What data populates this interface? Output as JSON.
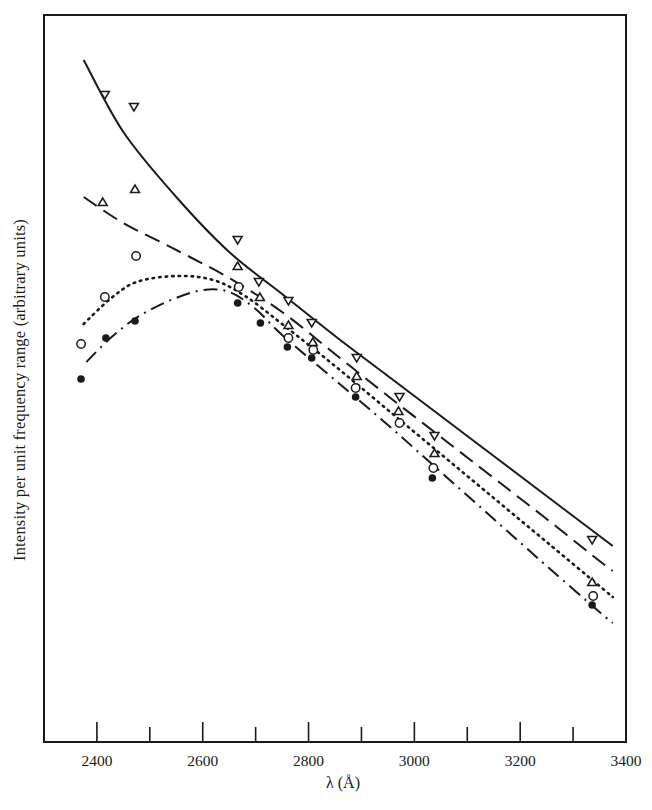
{
  "chart_data": {
    "type": "line",
    "title": "",
    "xlabel": "λ (Å)",
    "ylabel": "Intensity per unit frequency range (arbitrary units)",
    "xlim": [
      2300,
      3400
    ],
    "ylim": [
      0,
      72.7
    ],
    "x_ticks": [
      2400,
      2500,
      2600,
      2700,
      2800,
      2900,
      3000,
      3100,
      3200,
      3300,
      3400
    ],
    "x_tick_labels": [
      "2400",
      "2600",
      "2800",
      "3000",
      "3200",
      "3400"
    ],
    "y_ticks": [],
    "grid": false,
    "legend": "none",
    "series": [
      {
        "name": "down-triangle (solid curve)",
        "marker": "down-triangle",
        "line_style": "solid",
        "points": [
          [
            2415,
            64.7
          ],
          [
            2470,
            63.5
          ],
          [
            2666,
            50.2
          ],
          [
            2706,
            46.0
          ],
          [
            2762,
            44.1
          ],
          [
            2806,
            41.9
          ],
          [
            2891,
            38.4
          ],
          [
            2972,
            34.5
          ],
          [
            3038,
            30.6
          ],
          [
            3336,
            20.2
          ]
        ],
        "curve": [
          [
            2375,
            68.2
          ],
          [
            2450,
            61.0
          ],
          [
            2550,
            54.5
          ],
          [
            2650,
            49.0
          ],
          [
            2750,
            44.8
          ],
          [
            2850,
            40.6
          ],
          [
            2950,
            36.6
          ],
          [
            3050,
            32.6
          ],
          [
            3150,
            28.6
          ],
          [
            3250,
            24.6
          ],
          [
            3350,
            20.6
          ],
          [
            3375,
            19.6
          ]
        ]
      },
      {
        "name": "up-triangle (dashed curve)",
        "marker": "up-triangle",
        "line_style": "dashed",
        "points": [
          [
            2411,
            54.0
          ],
          [
            2472,
            55.3
          ],
          [
            2666,
            47.6
          ],
          [
            2708,
            44.5
          ],
          [
            2762,
            41.7
          ],
          [
            2808,
            40.0
          ],
          [
            2891,
            36.6
          ],
          [
            2970,
            33.1
          ],
          [
            3038,
            28.9
          ],
          [
            3336,
            16.0
          ]
        ],
        "curve": [
          [
            2375,
            54.5
          ],
          [
            2450,
            51.9
          ],
          [
            2550,
            49.2
          ],
          [
            2650,
            46.4
          ],
          [
            2750,
            43.0
          ],
          [
            2850,
            38.8
          ],
          [
            2950,
            34.6
          ],
          [
            3050,
            30.5
          ],
          [
            3150,
            26.4
          ],
          [
            3250,
            22.3
          ],
          [
            3350,
            18.1
          ],
          [
            3375,
            17.1
          ]
        ]
      },
      {
        "name": "open circle (dotted curve)",
        "marker": "open-circle",
        "line_style": "dotted",
        "points": [
          [
            2370,
            39.8
          ],
          [
            2415,
            44.5
          ],
          [
            2474,
            48.6
          ],
          [
            2668,
            45.5
          ],
          [
            2762,
            40.4
          ],
          [
            2809,
            39.2
          ],
          [
            2889,
            35.4
          ],
          [
            2972,
            31.9
          ],
          [
            3036,
            27.4
          ],
          [
            3338,
            14.6
          ]
        ],
        "curve": [
          [
            2375,
            41.8
          ],
          [
            2425,
            44.3
          ],
          [
            2475,
            46.0
          ],
          [
            2550,
            46.6
          ],
          [
            2620,
            46.2
          ],
          [
            2680,
            44.6
          ],
          [
            2750,
            41.8
          ],
          [
            2850,
            37.6
          ],
          [
            2950,
            33.2
          ],
          [
            3050,
            28.8
          ],
          [
            3150,
            24.4
          ],
          [
            3250,
            20.0
          ],
          [
            3350,
            15.6
          ],
          [
            3375,
            14.5
          ]
        ]
      },
      {
        "name": "filled circle (dash-dot curve)",
        "marker": "filled-circle",
        "line_style": "dash-dot",
        "points": [
          [
            2370,
            36.3
          ],
          [
            2417,
            40.4
          ],
          [
            2472,
            42.1
          ],
          [
            2666,
            43.9
          ],
          [
            2709,
            41.9
          ],
          [
            2760,
            39.5
          ],
          [
            2806,
            38.4
          ],
          [
            2889,
            34.5
          ],
          [
            3034,
            26.4
          ],
          [
            3336,
            13.7
          ]
        ],
        "curve": [
          [
            2380,
            38.0
          ],
          [
            2430,
            40.6
          ],
          [
            2480,
            42.6
          ],
          [
            2540,
            44.2
          ],
          [
            2600,
            45.2
          ],
          [
            2650,
            45.0
          ],
          [
            2700,
            43.3
          ],
          [
            2750,
            40.7
          ],
          [
            2850,
            36.2
          ],
          [
            2950,
            31.7
          ],
          [
            3050,
            27.0
          ],
          [
            3150,
            22.3
          ],
          [
            3250,
            17.6
          ],
          [
            3350,
            13.0
          ],
          [
            3375,
            11.9
          ]
        ]
      }
    ]
  },
  "axes": {
    "xlabel": "λ (Å)",
    "ylabel": "Intensity per unit frequency range (arbitrary units)",
    "tick_labels": [
      "2400",
      "2600",
      "2800",
      "3000",
      "3200",
      "3400"
    ]
  }
}
